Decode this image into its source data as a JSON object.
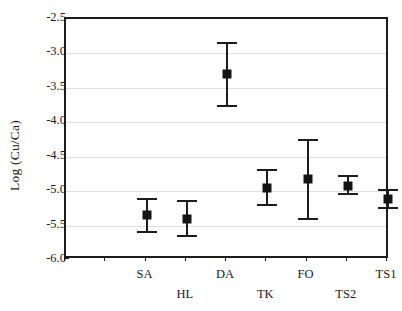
{
  "chart_data": {
    "type": "scatter",
    "title": "",
    "subtitle": "",
    "xlabel": "",
    "ylabel": "Log (Cu/Ca)",
    "ylim": [
      -6.0,
      -2.5
    ],
    "yticks": [
      -2.5,
      -3.0,
      -3.5,
      -4.0,
      -4.5,
      -5.0,
      -5.5,
      -6.0
    ],
    "ytick_labels": [
      "-2.5",
      "-3.0",
      "-3.5",
      "-4.0",
      "-4.5",
      "-5.0",
      "-5.5",
      "-6.0"
    ],
    "grid": true,
    "grid_axis": "y",
    "legend": "none",
    "marker_style": "filled-square",
    "error_style": "capped-whisker",
    "categories": [
      "SA",
      "HL",
      "DA",
      "TK",
      "FO",
      "TS2",
      "TS1"
    ],
    "label_rows": [
      0,
      1,
      0,
      1,
      0,
      1,
      0
    ],
    "values": [
      -5.35,
      -5.4,
      -3.3,
      -4.96,
      -4.82,
      -4.92,
      -5.11
    ],
    "err_upper": [
      -5.1,
      -5.13,
      -2.83,
      -4.68,
      -4.24,
      -4.76,
      -4.97
    ],
    "err_lower": [
      -5.61,
      -5.67,
      -3.78,
      -5.22,
      -5.42,
      -5.06,
      -5.26
    ],
    "points": [
      {
        "category": "SA",
        "value": -5.35,
        "upper": -5.1,
        "lower": -5.61,
        "slot": 2
      },
      {
        "category": "HL",
        "value": -5.4,
        "upper": -5.13,
        "lower": -5.67,
        "slot": 3
      },
      {
        "category": "DA",
        "value": -3.3,
        "upper": -2.83,
        "lower": -3.78,
        "slot": 4
      },
      {
        "category": "TK",
        "value": -4.96,
        "upper": -4.68,
        "lower": -5.22,
        "slot": 5
      },
      {
        "category": "FO",
        "value": -4.82,
        "upper": -4.24,
        "lower": -5.42,
        "slot": 6
      },
      {
        "category": "TS2",
        "value": -4.92,
        "upper": -4.76,
        "lower": -5.06,
        "slot": 7
      },
      {
        "category": "TS1",
        "value": -5.11,
        "upper": -4.97,
        "lower": -5.26,
        "slot": 8
      }
    ],
    "colors": {
      "marker": "#141414",
      "error": "#1c1c1c",
      "axis": "#1c1c1c",
      "grid": "#dedede",
      "background": "#ffffff"
    }
  }
}
